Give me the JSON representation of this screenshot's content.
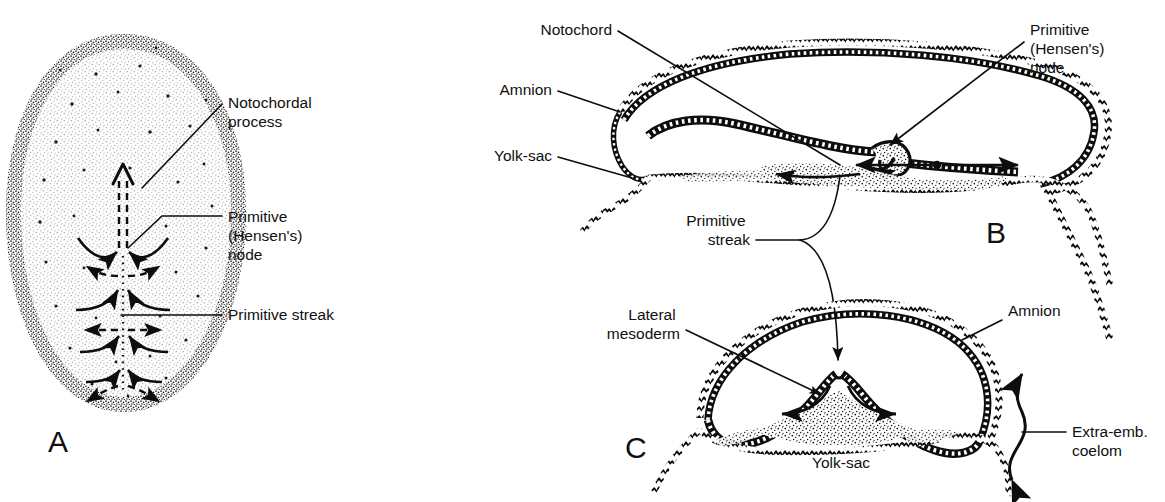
{
  "figure": {
    "background_color": "#ffffff",
    "ink_color": "#0d0d0d",
    "width": 1165,
    "height": 502
  },
  "panels": [
    {
      "id": "A",
      "letter": "A",
      "letter_x": 48,
      "letter_y": 452,
      "view": "surface view of embryonic disc (dorsal)",
      "labels": [
        {
          "key": "notochordal_process",
          "lines": [
            "Notochordal",
            "process"
          ],
          "x": 228,
          "y": 108,
          "anchor": "start",
          "leader": "M 222 104 L 142 188"
        },
        {
          "key": "primitive_node",
          "lines": [
            "Primitive",
            "(Hensen's)",
            "node"
          ],
          "x": 228,
          "y": 222,
          "anchor": "start",
          "leader": "M 222 216 L 162 216 L 128 248"
        },
        {
          "key": "primitive_streak",
          "lines": [
            "Primitive streak"
          ],
          "x": 228,
          "y": 320,
          "anchor": "start",
          "leader": "M 222 315 L 121 315"
        }
      ]
    },
    {
      "id": "B",
      "letter": "B",
      "letter_x": 986,
      "letter_y": 243,
      "view": "transverse section through the primitive node",
      "labels": [
        {
          "key": "notochord",
          "lines": [
            "Notochord"
          ],
          "x": 612,
          "y": 35,
          "anchor": "end",
          "leader": "M 618 31 L 840 165"
        },
        {
          "key": "amnion",
          "lines": [
            "Amnion"
          ],
          "x": 552,
          "y": 95,
          "anchor": "end",
          "leader": "M 558 91 L 620 112"
        },
        {
          "key": "yolk_sac",
          "lines": [
            "Yolk-sac"
          ],
          "x": 552,
          "y": 161,
          "anchor": "end",
          "leader": "M 558 157 L 632 178"
        },
        {
          "key": "primitive_node",
          "lines": [
            "Primitive",
            "(Hensen's)",
            "node"
          ],
          "x": 1030,
          "y": 35,
          "anchor": "start",
          "leader": "M 1024 42 L 885 140"
        },
        {
          "key": "primitive_streak",
          "lines": [
            "Primitive",
            "streak"
          ],
          "x": 750,
          "y": 226,
          "anchor": "end",
          "leader": "M 756 240 Q 812 242 838 176"
        }
      ]
    },
    {
      "id": "C",
      "letter": "C",
      "letter_x": 625,
      "letter_y": 458,
      "view": "transverse section through the primitive streak",
      "labels": [
        {
          "key": "lateral_mesoderm",
          "lines": [
            "Lateral",
            "mesoderm"
          ],
          "x": 680,
          "y": 320,
          "anchor": "end",
          "leader": "M 686 330 L 820 390"
        },
        {
          "key": "amnion",
          "lines": [
            "Amnion"
          ],
          "x": 1008,
          "y": 316,
          "anchor": "start",
          "leader": "M 1002 320 L 962 340"
        },
        {
          "key": "yolk_sac",
          "lines": [
            "Yolk-sac"
          ],
          "x": 812,
          "y": 462,
          "anchor": "start",
          "leader": ""
        },
        {
          "key": "extra_emb_coelom",
          "lines": [
            "Extra-emb.",
            "coelom"
          ],
          "x": 1072,
          "y": 437,
          "anchor": "start",
          "leader": "M 1066 432 L 1022 432"
        },
        {
          "key": "primitive_streak_leader",
          "lines": [],
          "x": 0,
          "y": 0,
          "anchor": "start",
          "leader": "M 756 240 Q 830 250 838 368"
        }
      ]
    }
  ],
  "label_text": {
    "notochordal_process_1": "Notochordal",
    "notochordal_process_2": "process",
    "primitive_1": "Primitive",
    "hensens_2": "(Hensen's)",
    "node_3": "node",
    "primitive_streak_single": "Primitive streak",
    "notochord": "Notochord",
    "amnion": "Amnion",
    "yolk_sac": "Yolk-sac",
    "streak_2": "streak",
    "lateral_1": "Lateral",
    "mesoderm_2": "mesoderm",
    "extra_emb_1": "Extra-emb.",
    "coelom_2": "coelom",
    "letter_a": "A",
    "letter_b": "B",
    "letter_c": "C"
  }
}
